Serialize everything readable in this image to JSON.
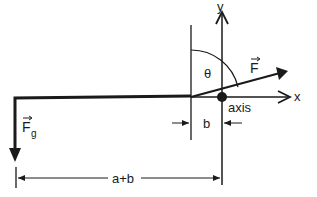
{
  "diagram": {
    "type": "free-body / torque diagram",
    "colors": {
      "ink": "#1a1a1a",
      "background": "#ffffff"
    },
    "labels": {
      "y_axis": "y",
      "x_axis": "x",
      "angle": "θ",
      "force": "F",
      "gravity_force": "F",
      "gravity_subscript": "g",
      "pivot": "axis",
      "short_distance": "b",
      "long_distance": "a+b"
    },
    "elements": [
      {
        "name": "beam",
        "description": "horizontal thick beam with left end bending down into Fg arrow"
      },
      {
        "name": "pole",
        "description": "thin vertical line where force F is applied"
      },
      {
        "name": "y-axis",
        "description": "vertical arrow labeled y through pivot"
      },
      {
        "name": "x-axis",
        "description": "horizontal arrow labeled x"
      },
      {
        "name": "force-F",
        "description": "arrow from pole base up-right at angle θ from vertical"
      },
      {
        "name": "pivot-dot",
        "description": "filled circle at axis"
      },
      {
        "name": "dimension-b",
        "description": "distance between pole and axis"
      },
      {
        "name": "dimension-a-plus-b",
        "description": "distance from Fg line to axis"
      }
    ]
  }
}
